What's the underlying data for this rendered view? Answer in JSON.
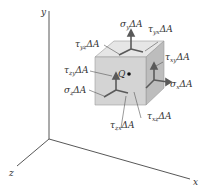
{
  "figure": {
    "axes": {
      "x_label": "x",
      "y_label": "y",
      "z_label": "z"
    },
    "point_label": "Q",
    "force_labels": {
      "sigma_y": {
        "sym": "σ",
        "sub": "y",
        "tail": "ΔA"
      },
      "tau_yx": {
        "sym": "τ",
        "sub": "yx",
        "tail": "ΔA"
      },
      "tau_yz": {
        "sym": "τ",
        "sub": "yz",
        "tail": "ΔA"
      },
      "tau_zy": {
        "sym": "τ",
        "sub": "zy",
        "tail": "ΔA"
      },
      "sigma_z": {
        "sym": "σ",
        "sub": "z",
        "tail": "ΔA"
      },
      "tau_xy": {
        "sym": "τ",
        "sub": "xy",
        "tail": "ΔA"
      },
      "sigma_x": {
        "sym": "σ",
        "sub": "x",
        "tail": "ΔA"
      },
      "tau_zx": {
        "sym": "τ",
        "sub": "zx",
        "tail": "ΔA"
      },
      "tau_xz": {
        "sym": "τ",
        "sub": "xz",
        "tail": "ΔA"
      }
    },
    "colors": {
      "axis": "#444444",
      "cube_front": "#d4d4d4",
      "cube_top": "#e6e6e6",
      "cube_side": "#bdbdbd",
      "arrow": "#5a5a5a",
      "text": "#333333"
    }
  }
}
